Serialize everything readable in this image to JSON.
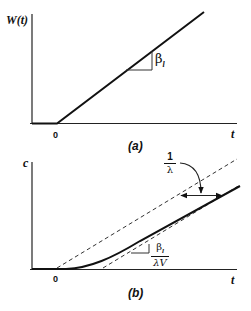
{
  "figure": {
    "panel_a": {
      "y_label": "W(t)",
      "x_label": "t",
      "origin_label": "0",
      "slope_label_symbol": "β",
      "slope_label_subscript": "l",
      "caption": "(a)"
    },
    "panel_b": {
      "y_label": "c",
      "x_label": "t",
      "origin_label": "0",
      "offset_label_num": "1",
      "offset_label_den": "λ",
      "slope_label_num_symbol": "β",
      "slope_label_num_subscript": "l",
      "slope_label_den": "λV",
      "caption": "(b)"
    },
    "colors": {
      "ink": "#111111",
      "background": "#ffffff"
    }
  }
}
